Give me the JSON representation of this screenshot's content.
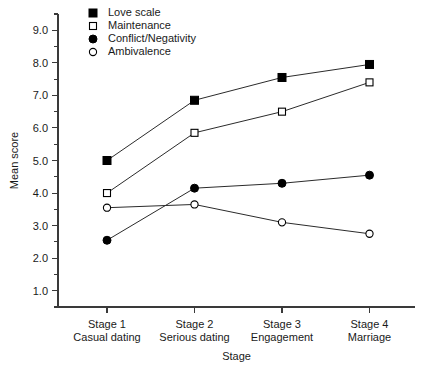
{
  "chart_data": {
    "type": "line",
    "title": "",
    "xlabel": "Stage",
    "ylabel": "Mean score",
    "categories": [
      "Stage 1",
      "Stage 2",
      "Stage 3",
      "Stage 4"
    ],
    "category_sublabels": [
      "Casual dating",
      "Serious dating",
      "Engagement",
      "Marriage"
    ],
    "ylim": [
      0.5,
      9.5
    ],
    "yticks": [
      1.0,
      2.0,
      3.0,
      4.0,
      5.0,
      6.0,
      7.0,
      8.0,
      9.0
    ],
    "ytick_labels": [
      "1.0",
      "2.0",
      "3.0",
      "4.0",
      "5.0",
      "6.0",
      "7.0",
      "8.0",
      "9.0"
    ],
    "yminor_ticks": [
      1.5,
      2.5,
      3.5,
      4.5,
      5.5,
      6.5,
      7.5,
      8.5
    ],
    "grid": false,
    "legend_position": "top-left-inside",
    "series": [
      {
        "name": "Love scale",
        "marker": "filled-square",
        "values": [
          5.0,
          6.85,
          7.55,
          7.95
        ]
      },
      {
        "name": "Maintenance",
        "marker": "open-square",
        "values": [
          4.0,
          5.85,
          6.5,
          7.4
        ]
      },
      {
        "name": "Conflict/Negativity",
        "marker": "filled-circle",
        "values": [
          2.55,
          4.15,
          4.3,
          4.55
        ]
      },
      {
        "name": "Ambivalence",
        "marker": "open-circle",
        "values": [
          3.55,
          3.65,
          3.1,
          2.75
        ]
      }
    ]
  },
  "colors": {
    "axis": "#3a3a3a",
    "line": "#2b2b2b",
    "marker_fill": "#000000",
    "marker_open_fill": "#ffffff",
    "text": "#1a1a1a",
    "background": "#ffffff"
  }
}
